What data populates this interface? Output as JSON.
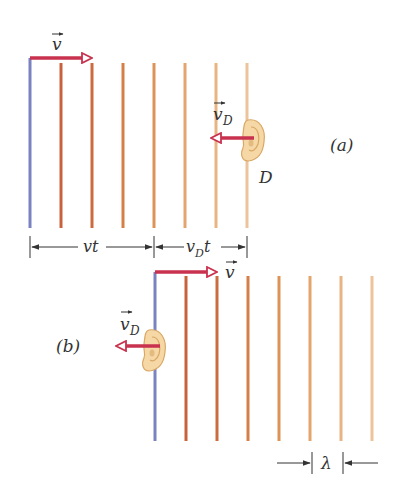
{
  "figure": {
    "panel_a": {
      "label": "(a)",
      "velocity_label": "v",
      "detector_velocity_label": "v",
      "detector_velocity_subscript": "D",
      "detector_label": "D",
      "dimension_1": "vt",
      "dimension_2_main": "v",
      "dimension_2_sub": "D",
      "dimension_2_tail": "t",
      "wavefront_x": [
        30,
        61,
        92,
        123,
        154,
        185,
        216,
        247
      ]
    },
    "panel_b": {
      "label": "(b)",
      "velocity_label": "v",
      "detector_velocity_label": "v",
      "detector_velocity_subscript": "D",
      "wavelength_label": "λ",
      "wavefront_x": [
        155,
        186,
        217,
        248,
        279,
        310,
        341,
        372
      ]
    },
    "colors": {
      "source_wavefront": "#7b82c2",
      "wavefront_gradient": [
        "#c8623a",
        "#cc6b3e",
        "#d57e48",
        "#dd9358",
        "#e3a56c",
        "#e8b481",
        "#ecc39a"
      ],
      "velocity_arrow": "#c8324e",
      "ear_fill": "#f6d7a6",
      "ear_stroke": "#d9a865"
    }
  }
}
